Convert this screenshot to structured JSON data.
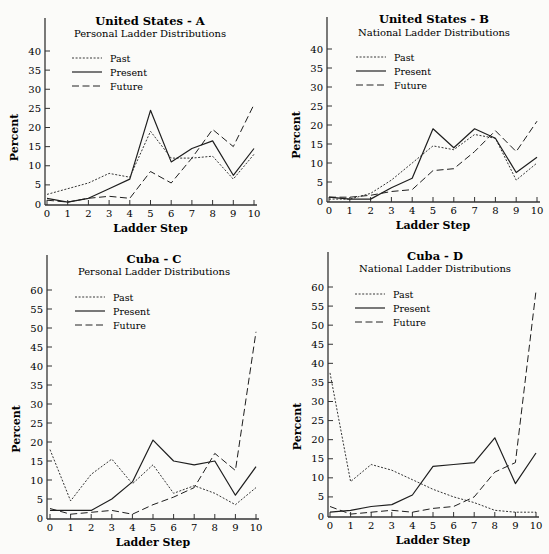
{
  "chart_data": [
    {
      "id": "us-a",
      "type": "line",
      "title": "United States - A",
      "subtitle": "Personal Ladder Distributions",
      "xlabel": "Ladder Step",
      "ylabel": "Percent",
      "x": [
        0,
        1,
        2,
        3,
        4,
        5,
        6,
        7,
        8,
        9,
        10
      ],
      "ylim": [
        0,
        40
      ],
      "yticks": [
        0,
        5,
        10,
        15,
        20,
        25,
        30,
        35,
        40
      ],
      "legend": [
        "Past",
        "Present",
        "Future"
      ],
      "series": [
        {
          "name": "Past",
          "style": "dotted",
          "values": [
            2.5,
            4,
            5.5,
            8,
            7,
            19,
            12,
            12,
            12.5,
            6.5,
            13
          ]
        },
        {
          "name": "Present",
          "style": "solid",
          "values": [
            1.5,
            0.5,
            1.5,
            4,
            6.5,
            24.5,
            11,
            14.5,
            16.5,
            7.5,
            14.5
          ]
        },
        {
          "name": "Future",
          "style": "dashed",
          "values": [
            1,
            0.5,
            1.5,
            2,
            1.5,
            8.5,
            5.5,
            12,
            19.5,
            15,
            26
          ]
        }
      ],
      "layout": {
        "ox": 47,
        "oy": 204,
        "xend": 254,
        "ytop_px": 51,
        "ytop_val": 40,
        "axis_top": 18,
        "axis_x": 45,
        "title_cx": 150,
        "title_y": 25,
        "sub_y": 37,
        "legend_x": 72,
        "legend_y": 58,
        "ylabel_x": 18
      }
    },
    {
      "id": "us-b",
      "type": "line",
      "title": "United States - B",
      "subtitle": "National Ladder Distributions",
      "xlabel": "Ladder Step",
      "ylabel": "Percent",
      "x": [
        0,
        1,
        2,
        3,
        4,
        5,
        6,
        7,
        8,
        9,
        10
      ],
      "ylim": [
        0,
        40
      ],
      "yticks": [
        0,
        5,
        10,
        15,
        20,
        25,
        30,
        35,
        40
      ],
      "legend": [
        "Past",
        "Present",
        "Future"
      ],
      "series": [
        {
          "name": "Past",
          "style": "dotted",
          "values": [
            0.5,
            0.5,
            2,
            5.5,
            10,
            14.5,
            13.5,
            17.5,
            16.5,
            5.5,
            10
          ]
        },
        {
          "name": "Present",
          "style": "solid",
          "values": [
            1,
            0.5,
            0.5,
            3.5,
            6,
            19,
            14,
            19,
            16.5,
            7.5,
            11.5
          ]
        },
        {
          "name": "Future",
          "style": "dashed",
          "values": [
            1,
            1,
            1.5,
            2.5,
            3,
            8,
            8.5,
            13,
            18.5,
            13,
            21
          ]
        }
      ],
      "layout": {
        "ox": 329,
        "oy": 201,
        "xend": 537,
        "ytop_px": 49,
        "ytop_val": 40,
        "axis_top": 17,
        "axis_x": 327,
        "title_cx": 434,
        "title_y": 23,
        "sub_y": 36,
        "legend_x": 356,
        "legend_y": 57,
        "ylabel_x": 300
      }
    },
    {
      "id": "cuba-c",
      "type": "line",
      "title": "Cuba - C",
      "subtitle": "Personal Ladder Distributions",
      "xlabel": "Ladder Step",
      "ylabel": "Percent",
      "x": [
        0,
        1,
        2,
        3,
        4,
        5,
        6,
        7,
        8,
        9,
        10
      ],
      "ylim": [
        0,
        60
      ],
      "yticks": [
        0,
        5,
        10,
        15,
        20,
        25,
        30,
        35,
        40,
        45,
        50,
        55,
        60
      ],
      "legend": [
        "Past",
        "Present",
        "Future"
      ],
      "series": [
        {
          "name": "Past",
          "style": "dotted",
          "values": [
            18,
            4.5,
            11.5,
            15.5,
            9,
            14,
            6.5,
            8.5,
            6.5,
            3.5,
            8
          ]
        },
        {
          "name": "Present",
          "style": "solid",
          "values": [
            2,
            2,
            2,
            5,
            9.5,
            20.5,
            15,
            14,
            15,
            6,
            13.5
          ]
        },
        {
          "name": "Future",
          "style": "dashed",
          "values": [
            2.5,
            1,
            1.5,
            2,
            1,
            3.5,
            5.5,
            8,
            17,
            12.5,
            49
          ]
        }
      ],
      "layout": {
        "ox": 50,
        "oy": 518,
        "xend": 256,
        "ytop_px": 290,
        "ytop_val": 60,
        "axis_top": 255,
        "axis_x": 47,
        "title_cx": 154,
        "title_y": 263,
        "sub_y": 275,
        "legend_x": 75,
        "legend_y": 297,
        "ylabel_x": 20
      }
    },
    {
      "id": "cuba-d",
      "type": "line",
      "title": "Cuba - D",
      "subtitle": "National Ladder Distributions",
      "xlabel": "Ladder Step",
      "ylabel": "Percent",
      "x": [
        0,
        1,
        2,
        3,
        4,
        5,
        6,
        7,
        8,
        9,
        10
      ],
      "ylim": [
        0,
        60
      ],
      "yticks": [
        0,
        5,
        10,
        15,
        20,
        25,
        30,
        35,
        40,
        45,
        50,
        55,
        60
      ],
      "legend": [
        "Past",
        "Present",
        "Future"
      ],
      "series": [
        {
          "name": "Past",
          "style": "dotted",
          "values": [
            37.5,
            9,
            13.5,
            12,
            9.5,
            7,
            5,
            3.5,
            1.5,
            1,
            1
          ]
        },
        {
          "name": "Present",
          "style": "solid",
          "values": [
            1,
            1.5,
            2.5,
            3,
            5.5,
            13,
            13.5,
            14,
            20.5,
            8.5,
            16.5
          ]
        },
        {
          "name": "Future",
          "style": "dashed",
          "values": [
            2.5,
            0.5,
            1,
            1.5,
            1,
            2,
            2.5,
            5,
            11.5,
            14,
            59
          ]
        }
      ],
      "layout": {
        "ox": 330,
        "oy": 516,
        "xend": 536,
        "ytop_px": 287,
        "ytop_val": 60,
        "axis_top": 252,
        "axis_x": 328,
        "title_cx": 435,
        "title_y": 260,
        "sub_y": 272,
        "legend_x": 355,
        "legend_y": 294,
        "ylabel_x": 301
      }
    }
  ]
}
